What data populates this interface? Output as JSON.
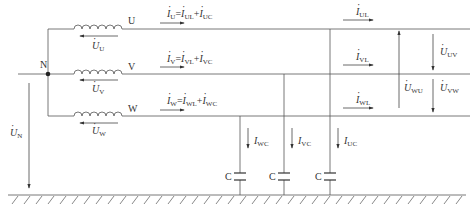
{
  "diagram": {
    "type": "three-phase circuit with line-to-ground capacitances",
    "neutral_label": "N",
    "phases": [
      {
        "name": "U",
        "source_voltage": "U",
        "current_main": "U",
        "current_parts": [
          "UL",
          "UC"
        ],
        "load_current": "UL",
        "cap_current": "UC"
      },
      {
        "name": "V",
        "source_voltage": "V",
        "current_main": "V",
        "current_parts": [
          "VL",
          "VC"
        ],
        "load_current": "VL",
        "cap_current": "VC"
      },
      {
        "name": "W",
        "source_voltage": "W",
        "current_main": "W",
        "current_parts": [
          "WL",
          "WC"
        ],
        "load_current": "WL",
        "cap_current": "WC"
      }
    ],
    "line_voltages": [
      "UV",
      "WU",
      "VW"
    ],
    "neutral_voltage": "N",
    "capacitor_label": "C",
    "symbols": {
      "I": "I",
      "U": "U",
      "eq": "=",
      "plus": "+"
    }
  }
}
